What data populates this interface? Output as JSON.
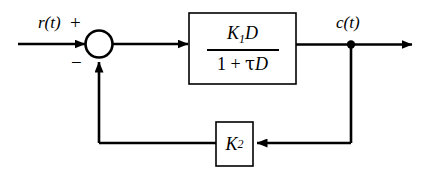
{
  "diagram": {
    "stroke_color": "#000000",
    "background_color": "#ffffff",
    "signals": {
      "input_label": "r(t)",
      "output_label": "c(t)"
    },
    "summing_junction": {
      "name": "summing-junction",
      "positive_sign": "+",
      "negative_sign": "−",
      "shape": "circle",
      "filled": false
    },
    "forward_block": {
      "name": "forward-transfer-block",
      "numerator": {
        "gain": "K",
        "gain_subscript": "1",
        "operator": "D"
      },
      "denominator": {
        "constant": "1",
        "plus": "+",
        "tau": "τ",
        "operator": "D"
      },
      "expression": "K₁D / (1 + τD)"
    },
    "feedback_block": {
      "name": "feedback-gain-block",
      "gain": "K",
      "gain_subscript": "2",
      "expression": "K₂"
    }
  }
}
